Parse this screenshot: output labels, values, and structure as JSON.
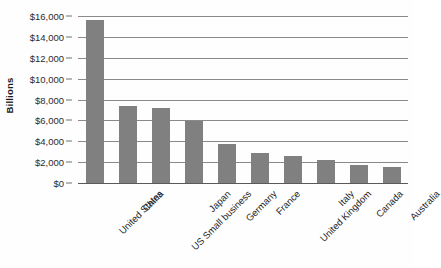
{
  "chart_data": {
    "type": "bar",
    "title": "",
    "subtitle": "",
    "xlabel": "",
    "ylabel": "Billions",
    "categories": [
      "United States",
      "China",
      "US Small business",
      "Japan",
      "Germany",
      "France",
      "United Kingdom",
      "Italy",
      "Canada",
      "Australia"
    ],
    "values": [
      15600,
      7350,
      7200,
      5900,
      3700,
      2900,
      2600,
      2200,
      1750,
      1500
    ],
    "ylim": [
      0,
      16000
    ],
    "ytick_step": 2000,
    "ytick_labels": [
      "$16,000",
      "$14,000",
      "$12,000",
      "$10,000",
      "$8,000",
      "$6,000",
      "$4,000",
      "$2,000",
      "$0"
    ],
    "ytick_values": [
      16000,
      14000,
      12000,
      10000,
      8000,
      6000,
      4000,
      2000,
      0
    ],
    "grid": true,
    "grid_orientation": "horizontal",
    "legend": false,
    "legend_position": "none",
    "bar_color": "#808080",
    "gridline_color": "#8a8a8a",
    "axis_color": "#5a5a5a",
    "background_color": "#fefefe",
    "xtick_rotation": -45,
    "annotations": []
  }
}
